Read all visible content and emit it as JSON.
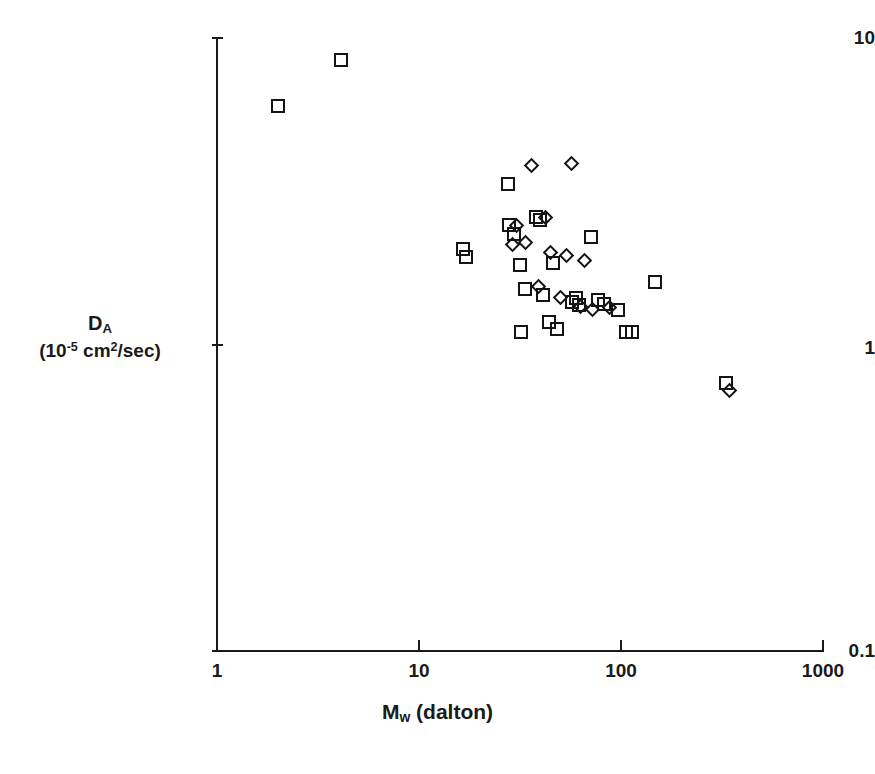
{
  "figure": {
    "background": "#ffffff",
    "marker_color": "#141414"
  },
  "axes": {
    "x_label": "M",
    "x_label_sub": "w",
    "x_label_rest": " (dalton)",
    "y_label_main": "D",
    "y_label_main_sub": "A",
    "y_label_units_pre": "(10",
    "y_label_units_exp": "-5",
    "y_label_units_mid": " cm",
    "y_label_units_exp2": "2",
    "y_label_units_post": "/sec)",
    "x_ticks": [
      "1",
      "10",
      "100",
      "1000"
    ],
    "y_ticks": [
      "10",
      "1",
      "0.1"
    ]
  },
  "chart_data": {
    "type": "scatter",
    "title": "",
    "xlabel": "Mw (dalton)",
    "ylabel": "DA (10-5 cm2/sec)",
    "xscale": "log",
    "yscale": "log",
    "xlim": [
      1,
      1000
    ],
    "ylim": [
      0.1,
      10
    ],
    "xticks": [
      1,
      10,
      100,
      1000
    ],
    "yticks": [
      0.1,
      1,
      10
    ],
    "grid": false,
    "legend": "none",
    "series": [
      {
        "name": "squares",
        "marker": "square",
        "points": [
          [
            2.0,
            6.0
          ],
          [
            4.1,
            8.5
          ],
          [
            16.5,
            2.05
          ],
          [
            17.0,
            1.93
          ],
          [
            27.5,
            3.35
          ],
          [
            28.0,
            2.45
          ],
          [
            29.5,
            2.3
          ],
          [
            31.5,
            1.82
          ],
          [
            32.0,
            1.1
          ],
          [
            38.0,
            2.6
          ],
          [
            39.5,
            2.55
          ],
          [
            33.5,
            1.52
          ],
          [
            41.0,
            1.45
          ],
          [
            44.0,
            1.18
          ],
          [
            46.0,
            1.85
          ],
          [
            48.0,
            1.12
          ],
          [
            57.0,
            1.38
          ],
          [
            60.0,
            1.42
          ],
          [
            62.0,
            1.35
          ],
          [
            71.0,
            2.25
          ],
          [
            77.0,
            1.4
          ],
          [
            82.0,
            1.36
          ],
          [
            97.0,
            1.3
          ],
          [
            106.0,
            1.1
          ],
          [
            113.0,
            1.1
          ],
          [
            147.0,
            1.6
          ],
          [
            330.0,
            0.75
          ]
        ]
      },
      {
        "name": "diamonds",
        "marker": "diamond",
        "points": [
          [
            36.0,
            3.85
          ],
          [
            57.0,
            3.9
          ],
          [
            30.5,
            2.45
          ],
          [
            42.5,
            2.6
          ],
          [
            33.5,
            2.15
          ],
          [
            45.0,
            2.0
          ],
          [
            29.0,
            2.12
          ],
          [
            54.0,
            1.95
          ],
          [
            66.0,
            1.88
          ],
          [
            39.0,
            1.55
          ],
          [
            50.0,
            1.42
          ],
          [
            63.0,
            1.33
          ],
          [
            72.0,
            1.3
          ],
          [
            88.0,
            1.32
          ],
          [
            343.0,
            0.71
          ]
        ]
      }
    ]
  }
}
